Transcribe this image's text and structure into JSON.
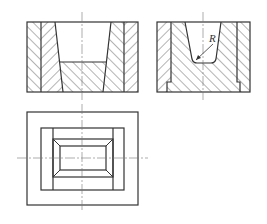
{
  "drawing": {
    "type": "orthographic engineering drawing",
    "views": [
      {
        "name": "front-section-view",
        "description": "Full section with tapered cavity and flat bottom"
      },
      {
        "name": "side-section-view",
        "description": "Section with tapered cavity, filleted bottom, radius callout"
      },
      {
        "name": "top-view",
        "description": "Plan view with nested rectangles and chamfered cavity"
      }
    ],
    "annotations": {
      "radius_label": "R"
    },
    "colors": {
      "line": "#333333",
      "center_line": "#777777",
      "background": "#ffffff"
    }
  }
}
